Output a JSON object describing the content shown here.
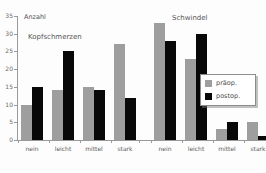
{
  "chart_data": {
    "type": "bar",
    "title": "",
    "ylabel": "Anzahl",
    "xlabel": "",
    "ylim": [
      0,
      35
    ],
    "yticks": [
      0,
      5,
      10,
      15,
      20,
      25,
      30,
      35
    ],
    "ytick_labels": [
      "0",
      "5",
      "10",
      "15",
      "20",
      "25",
      "30",
      "35"
    ],
    "grid": false,
    "legend_position": "center-right",
    "panels": [
      {
        "title": "Kopfschmerzen",
        "categories": [
          "nein",
          "leicht",
          "mittel",
          "stark"
        ],
        "series": [
          {
            "name": "präop.",
            "color": "#9e9e9e",
            "values": [
              10,
              14,
              15,
              27
            ]
          },
          {
            "name": "postop.",
            "color": "#080808",
            "values": [
              15,
              25,
              14,
              12
            ]
          }
        ]
      },
      {
        "title": "Schwindel",
        "categories": [
          "nein",
          "leicht",
          "mittel",
          "stark"
        ],
        "series": [
          {
            "name": "präop.",
            "color": "#9e9e9e",
            "values": [
              33,
              23,
              3,
              5
            ]
          },
          {
            "name": "postop.",
            "color": "#080808",
            "values": [
              28,
              30,
              5,
              1
            ]
          }
        ]
      }
    ],
    "legend": [
      {
        "label": "präop.",
        "color": "#9e9e9e"
      },
      {
        "label": "postop.",
        "color": "#080808"
      }
    ]
  },
  "axis": {
    "y_title": "Anzahl",
    "ticks": [
      "35",
      "30",
      "25",
      "20",
      "15",
      "10",
      "5",
      "0"
    ]
  },
  "panel_titles": {
    "left": "Kopfschmerzen",
    "right": "Schwindel"
  },
  "legend_labels": {
    "pre": "präop.",
    "post": "postop."
  }
}
